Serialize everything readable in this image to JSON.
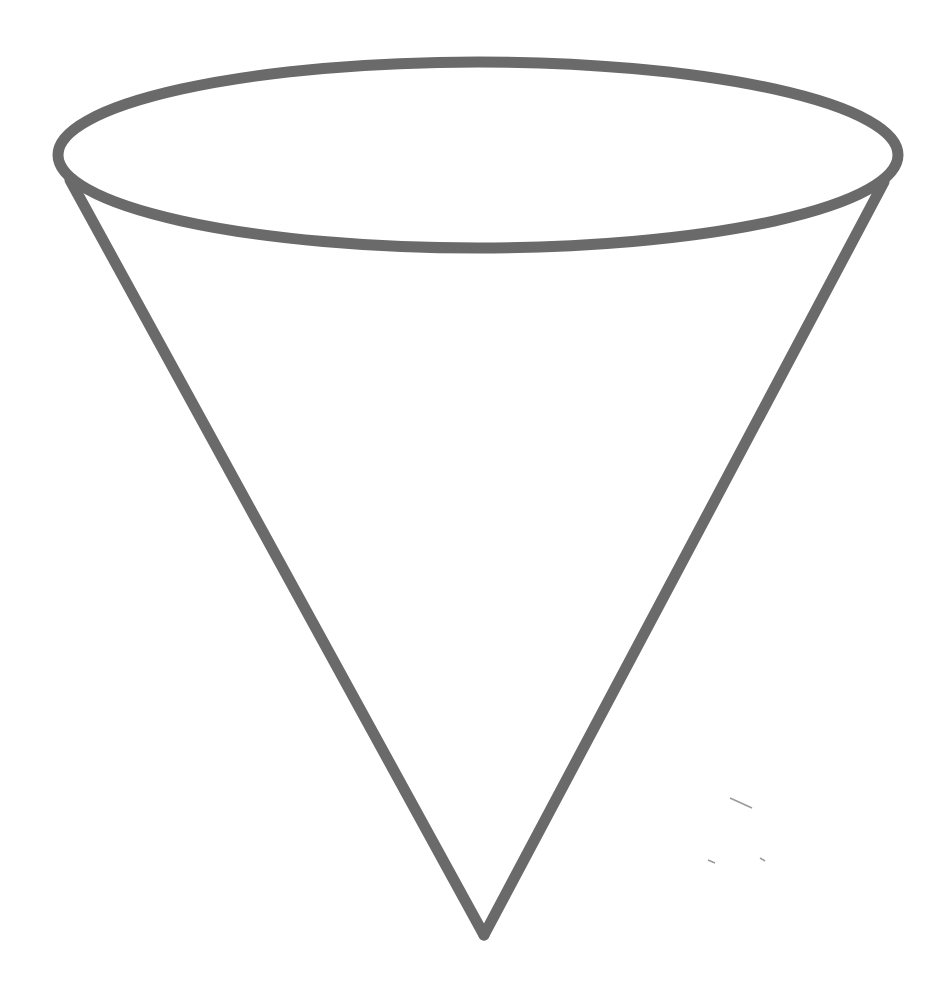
{
  "figure": {
    "type": "cone-outline",
    "stroke_color": "#6a6a6a",
    "background_color": "#ffffff",
    "stroke_width": 11,
    "rim": {
      "cx": 478,
      "cy": 155,
      "rx": 420,
      "ry": 93
    },
    "left_side": {
      "x1": 70,
      "y1": 180,
      "x2": 484,
      "y2": 935
    },
    "right_side": {
      "x1": 884,
      "y1": 182,
      "x2": 484,
      "y2": 935
    },
    "stray_marks": [
      {
        "x1": 730,
        "y1": 798,
        "x2": 752,
        "y2": 808
      },
      {
        "x1": 708,
        "y1": 860,
        "x2": 715,
        "y2": 863
      },
      {
        "x1": 760,
        "y1": 858,
        "x2": 765,
        "y2": 861
      }
    ]
  }
}
